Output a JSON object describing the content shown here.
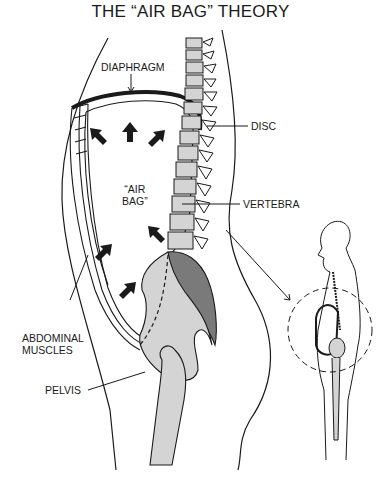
{
  "title": "THE “AIR BAG” THEORY",
  "labels": {
    "diaphragm": "DIAPHRAGM",
    "disc": "DISC",
    "air_bag_line1": "“AIR",
    "air_bag_line2": "BAG”",
    "vertebra": "VERTEBRA",
    "abdominal_line1": "ABDOMINAL",
    "abdominal_line2": "MUSCLES",
    "pelvis": "PELVIS"
  },
  "colors": {
    "line": "#1a1a1a",
    "bone_light": "#d4d4d4",
    "bone_dark": "#7a7a7a",
    "disc": "#f2f2f2",
    "background": "#ffffff"
  }
}
